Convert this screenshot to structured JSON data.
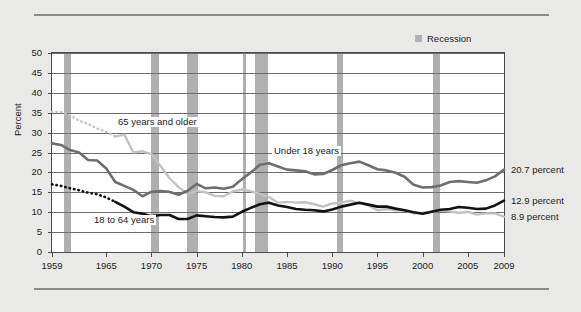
{
  "legend": {
    "recession_label": "Recession",
    "recession_color": "#b0b0b0"
  },
  "axis": {
    "ylabel": "Percent",
    "yticks": [
      "0",
      "5",
      "10",
      "15",
      "20",
      "25",
      "30",
      "35",
      "40",
      "45",
      "50"
    ],
    "xticks": [
      "1959",
      "1965",
      "1970",
      "1975",
      "1980",
      "1985",
      "1990",
      "1995",
      "2000",
      "2005",
      "2009"
    ]
  },
  "series_labels": {
    "older": "65 years and older",
    "under18": "Under 18 years",
    "adults": "18 to 64 years"
  },
  "end_labels": {
    "under18": "20.7 percent",
    "adults": "12.9 percent",
    "older": "8.9 percent"
  },
  "chart_data": {
    "type": "line",
    "title": "",
    "xlabel": "",
    "ylabel": "Percent",
    "xlim": [
      1959,
      2009
    ],
    "ylim": [
      0,
      50
    ],
    "ytick_step": 5,
    "grid": true,
    "legend_position": "top-right",
    "x": [
      1959,
      1960,
      1961,
      1962,
      1963,
      1964,
      1965,
      1966,
      1967,
      1968,
      1969,
      1970,
      1971,
      1972,
      1973,
      1974,
      1975,
      1976,
      1977,
      1978,
      1979,
      1980,
      1981,
      1982,
      1983,
      1984,
      1985,
      1986,
      1987,
      1988,
      1989,
      1990,
      1991,
      1992,
      1993,
      1994,
      1995,
      1996,
      1997,
      1998,
      1999,
      2000,
      2001,
      2002,
      2003,
      2004,
      2005,
      2006,
      2007,
      2008,
      2009
    ],
    "series": [
      {
        "name": "65 years and older",
        "color": "#c2c2c2",
        "dash_until_year": 1966,
        "end_value": 8.9,
        "values": [
          35.2,
          35.2,
          34.4,
          33.0,
          32.2,
          31.0,
          30.2,
          29.0,
          29.5,
          25.0,
          25.3,
          24.6,
          21.6,
          18.6,
          16.3,
          14.6,
          15.3,
          15.0,
          14.1,
          14.0,
          15.2,
          15.7,
          15.3,
          14.6,
          13.8,
          12.4,
          12.6,
          12.4,
          12.5,
          12.0,
          11.4,
          12.2,
          12.4,
          12.9,
          12.2,
          11.7,
          10.5,
          10.8,
          10.5,
          10.5,
          9.7,
          9.9,
          10.1,
          10.4,
          10.2,
          9.8,
          10.1,
          9.4,
          9.7,
          9.7,
          8.9
        ]
      },
      {
        "name": "Under 18 years",
        "color": "#6e6e6e",
        "end_value": 20.7,
        "values": [
          27.3,
          26.9,
          25.6,
          25.0,
          23.1,
          23.0,
          21.0,
          17.6,
          16.6,
          15.6,
          14.0,
          15.1,
          15.3,
          15.1,
          14.4,
          15.4,
          17.1,
          16.0,
          16.2,
          15.9,
          16.4,
          18.3,
          20.0,
          21.9,
          22.3,
          21.5,
          20.7,
          20.5,
          20.3,
          19.5,
          19.6,
          20.6,
          21.8,
          22.3,
          22.7,
          21.8,
          20.8,
          20.5,
          19.9,
          18.9,
          16.9,
          16.2,
          16.3,
          16.7,
          17.6,
          17.8,
          17.6,
          17.4,
          18.0,
          19.0,
          20.7
        ]
      },
      {
        "name": "18 to 64 years",
        "color": "#121212",
        "dash_until_year": 1966,
        "end_value": 12.9,
        "values": [
          17.0,
          16.6,
          16.0,
          15.5,
          14.9,
          14.5,
          13.7,
          12.6,
          11.4,
          10.0,
          9.6,
          9.0,
          9.3,
          9.3,
          8.3,
          8.3,
          9.2,
          9.0,
          8.8,
          8.7,
          8.9,
          10.1,
          11.1,
          12.0,
          12.4,
          11.7,
          11.3,
          10.8,
          10.6,
          10.5,
          10.2,
          10.7,
          11.4,
          11.9,
          12.4,
          11.9,
          11.4,
          11.4,
          10.9,
          10.5,
          10.0,
          9.6,
          10.1,
          10.6,
          10.8,
          11.3,
          11.1,
          10.8,
          10.9,
          11.7,
          12.9
        ]
      }
    ],
    "recessions": [
      {
        "start": 1960.3,
        "end": 1961.1
      },
      {
        "start": 1969.9,
        "end": 1970.8
      },
      {
        "start": 1973.9,
        "end": 1975.2
      },
      {
        "start": 1980.1,
        "end": 1980.5
      },
      {
        "start": 1981.5,
        "end": 1982.9
      },
      {
        "start": 1990.5,
        "end": 1991.2
      },
      {
        "start": 2001.2,
        "end": 2001.9
      }
    ]
  }
}
